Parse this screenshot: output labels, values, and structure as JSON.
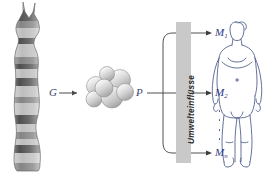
{
  "diagram": {
    "labels": {
      "gene": "G",
      "protein": "P",
      "environment": "Umwelteinflüsse"
    },
    "manifestations": [
      {
        "id": "m1",
        "base": "M",
        "index": "1"
      },
      {
        "id": "m2",
        "base": "M",
        "index": "2"
      },
      {
        "id": "mn",
        "base": "M",
        "index": "n"
      }
    ],
    "elements": {
      "chromosome": "chromosome-illustration",
      "protein_model": "protein-space-filling-model",
      "human": "human-body-figure"
    },
    "colors": {
      "label_blue": "#2f3a86",
      "gene_label": "#3a3f6b",
      "env_bar": "#c9c9c9",
      "line": "#3d3d3d",
      "figure_outline": "#4a5a86"
    }
  }
}
